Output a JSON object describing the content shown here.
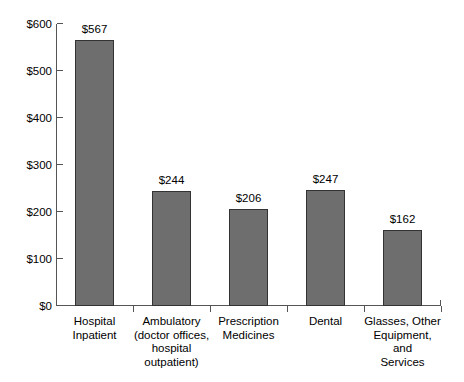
{
  "chart_data": {
    "type": "bar",
    "title": "",
    "subtitle": "",
    "xlabel": "",
    "ylabel": "",
    "ylim": [
      0,
      600
    ],
    "grid": false,
    "legend": false,
    "legend_position": "none",
    "y_ticks": [
      "$0",
      "$100",
      "$200",
      "$300",
      "$400",
      "$500",
      "$600"
    ],
    "y_tick_values": [
      0,
      100,
      200,
      300,
      400,
      500,
      600
    ],
    "categories": [
      "Hospital Inpatient",
      "Ambulatory (doctor offices, hospital outpatient)",
      "Prescription Medicines",
      "Dental",
      "Glasses, Other Equipment, and Services"
    ],
    "category_lines": [
      [
        "Hospital",
        "Inpatient"
      ],
      [
        "Ambulatory",
        "(doctor offices,",
        "hospital",
        "outpatient)"
      ],
      [
        "Prescription",
        "Medicines"
      ],
      [
        "Dental"
      ],
      [
        "Glasses, Other",
        "Equipment, and",
        "Services"
      ]
    ],
    "values": [
      567,
      244,
      206,
      247,
      162
    ],
    "value_labels": [
      "$567",
      "$244",
      "$206",
      "$247",
      "$162"
    ],
    "bar_color": "#6e6e6e",
    "bar_border_color": "#333333",
    "axis_color": "#555555",
    "background_color": "#ffffff"
  }
}
